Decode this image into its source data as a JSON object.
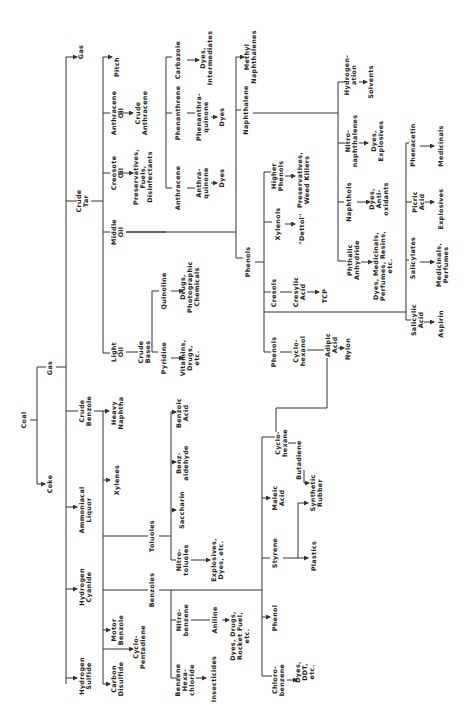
{
  "diagram": {
    "orientation": "rotated 90° counter-clockwise",
    "line_color": "#333333",
    "nodes": [
      {
        "id": "coal",
        "label": "Coal",
        "x": 25,
        "y": 420
      },
      {
        "id": "gas",
        "label": "Gas",
        "x": 51,
        "y": 368
      },
      {
        "id": "coke",
        "label": "Coke",
        "x": 51,
        "y": 484
      },
      {
        "id": "crude_tar",
        "label": "Crude\nTar",
        "x": 83,
        "y": 201
      },
      {
        "id": "gas2",
        "label": "Gas",
        "x": 82,
        "y": 52
      },
      {
        "id": "crude_benzole",
        "label": "Crude\nBenzole",
        "x": 86,
        "y": 411
      },
      {
        "id": "ammoniacal_liquor",
        "label": "Ammoniacal\nLiquor",
        "x": 86,
        "y": 510
      },
      {
        "id": "hydrogen_cyanide",
        "label": "Hydrogen\nCyanide",
        "x": 86,
        "y": 587
      },
      {
        "id": "hydrogen_sulfide",
        "label": "Hydrogen\nSulfide",
        "x": 86,
        "y": 676
      },
      {
        "id": "pitch",
        "label": "Pitch",
        "x": 118,
        "y": 67
      },
      {
        "id": "anthracene_oil",
        "label": "Anthracene\nOil",
        "x": 118,
        "y": 113
      },
      {
        "id": "crude_anthracene",
        "label": "Crude\nAnthracene",
        "x": 142,
        "y": 113
      },
      {
        "id": "creosote_oil",
        "label": "Creosote\nOil",
        "x": 118,
        "y": 173
      },
      {
        "id": "preservatives_fuels",
        "label": "Preservatives,\nFuels,\nDisinfectants",
        "x": 144,
        "y": 177
      },
      {
        "id": "middle_oil",
        "label": "Middle\nOil",
        "x": 118,
        "y": 232
      },
      {
        "id": "light_oil",
        "label": "Light\nOil",
        "x": 118,
        "y": 352
      },
      {
        "id": "crude_bases",
        "label": "Crude\nBases",
        "x": 145,
        "y": 352
      },
      {
        "id": "quinoline",
        "label": "Quinoline",
        "x": 165,
        "y": 291
      },
      {
        "id": "drugs_photo",
        "label": "Drugs,\nPhotographic\nChemicals",
        "x": 191,
        "y": 287
      },
      {
        "id": "pyridine",
        "label": "Pyridine",
        "x": 165,
        "y": 358
      },
      {
        "id": "vitamins",
        "label": "Vitamins,\nDrugs,\netc.",
        "x": 191,
        "y": 358
      },
      {
        "id": "heavy_naphtha",
        "label": "Heavy\nNaphtha",
        "x": 118,
        "y": 413
      },
      {
        "id": "xylenes",
        "label": "Xylenes",
        "x": 118,
        "y": 480
      },
      {
        "id": "toluoles",
        "label": "Toluoles",
        "x": 153,
        "y": 536
      },
      {
        "id": "benzoles",
        "label": "Benzoles",
        "x": 153,
        "y": 590
      },
      {
        "id": "motor_benzole",
        "label": "Motor\nBenzole",
        "x": 118,
        "y": 630
      },
      {
        "id": "cyclopentadiene",
        "label": "Cyclo-\nPentadiene",
        "x": 140,
        "y": 647
      },
      {
        "id": "carbon_disulfide",
        "label": "Carbon\nDisulfide",
        "x": 118,
        "y": 679
      },
      {
        "id": "benzoic_acid",
        "label": "Benzoic\nAcid",
        "x": 183,
        "y": 413
      },
      {
        "id": "benzaldehyde",
        "label": "Benz-\naldehyde",
        "x": 183,
        "y": 463
      },
      {
        "id": "saccharin",
        "label": "Saccharin",
        "x": 183,
        "y": 510
      },
      {
        "id": "nitrotoluoles",
        "label": "Nitro-\ntoluoles",
        "x": 183,
        "y": 560
      },
      {
        "id": "explosives_dyes",
        "label": "Explosives,\nDyes, etc.",
        "x": 218,
        "y": 560
      },
      {
        "id": "nitrobenzene",
        "label": "Nitro-\nbenzene",
        "x": 183,
        "y": 620
      },
      {
        "id": "aniline",
        "label": "Aniline",
        "x": 216,
        "y": 620
      },
      {
        "id": "dyes_drugs_rocket",
        "label": "Dyes, Drugs,\nRocket Fuel,\netc.",
        "x": 241,
        "y": 636
      },
      {
        "id": "benzene_hexachloride",
        "label": "Benzene\nHexa-\nchloride",
        "x": 186,
        "y": 680
      },
      {
        "id": "insecticides",
        "label": "Insecticides",
        "x": 215,
        "y": 679
      },
      {
        "id": "cyclohexane",
        "label": "Cyclo-\nhexane",
        "x": 282,
        "y": 443
      },
      {
        "id": "butadiene",
        "label": "Butadiene",
        "x": 300,
        "y": 460
      },
      {
        "id": "maleic_acid",
        "label": "Maleic\nAcid",
        "x": 279,
        "y": 498
      },
      {
        "id": "synthetic_rubber",
        "label": "Synthetic\nRubber",
        "x": 317,
        "y": 493
      },
      {
        "id": "styrene",
        "label": "Styrene",
        "x": 276,
        "y": 553
      },
      {
        "id": "plastics",
        "label": "Plastics",
        "x": 315,
        "y": 556
      },
      {
        "id": "phenol",
        "label": "Phenol",
        "x": 276,
        "y": 618
      },
      {
        "id": "chlorobenzene",
        "label": "Chloro-\nbenzene",
        "x": 279,
        "y": 680
      },
      {
        "id": "dyes_ddt",
        "label": "Dyes,\nDDT,\netc.",
        "x": 306,
        "y": 672
      },
      {
        "id": "anthracene",
        "label": "Anthracene",
        "x": 179,
        "y": 188
      },
      {
        "id": "anthraquinone",
        "label": "Anthra-\nquinone",
        "x": 203,
        "y": 183
      },
      {
        "id": "dyes_a",
        "label": "Dyes",
        "x": 223,
        "y": 178
      },
      {
        "id": "phenanthrene",
        "label": "Phenanthrene",
        "x": 179,
        "y": 113
      },
      {
        "id": "phenanthraquinone",
        "label": "Phenanthra-\nquinone",
        "x": 203,
        "y": 117
      },
      {
        "id": "dyes_b",
        "label": "Dyes",
        "x": 223,
        "y": 117
      },
      {
        "id": "carbazole",
        "label": "Carbazole",
        "x": 179,
        "y": 60
      },
      {
        "id": "dyes_intermediates",
        "label": "Dyes,\nIntermediates",
        "x": 207,
        "y": 58
      },
      {
        "id": "phenols_top",
        "label": "Phenols",
        "x": 249,
        "y": 262
      },
      {
        "id": "naphthalene",
        "label": "Naphthalene",
        "x": 247,
        "y": 110
      },
      {
        "id": "methyl_naphthalenes",
        "label": "Methyl\nNaphthalenes",
        "x": 251,
        "y": 57
      },
      {
        "id": "higher_phenols",
        "label": "Higher\nPhenols",
        "x": 278,
        "y": 176
      },
      {
        "id": "preservatives_weed",
        "label": "Preservatives,\nWeed Killers",
        "x": 304,
        "y": 180
      },
      {
        "id": "xylenols",
        "label": "Xylenols",
        "x": 279,
        "y": 224
      },
      {
        "id": "dettol",
        "label": "\"Dettol\"",
        "x": 303,
        "y": 229
      },
      {
        "id": "cresols",
        "label": "Cresols",
        "x": 275,
        "y": 293
      },
      {
        "id": "cresylic_acid",
        "label": "Cresylic\nAcid",
        "x": 300,
        "y": 292
      },
      {
        "id": "tcp",
        "label": "TCP",
        "x": 326,
        "y": 296
      },
      {
        "id": "phenols_bottom",
        "label": "Phenols",
        "x": 275,
        "y": 352
      },
      {
        "id": "cyclohexanol",
        "label": "Cyclo-\nhexanol",
        "x": 300,
        "y": 351
      },
      {
        "id": "adipic_acid",
        "label": "Adipic\nAcid",
        "x": 332,
        "y": 345
      },
      {
        "id": "nylon",
        "label": "Nylon",
        "x": 349,
        "y": 349
      },
      {
        "id": "hydrogenation",
        "label": "Hydrogen-\nation",
        "x": 351,
        "y": 75
      },
      {
        "id": "solvents",
        "label": "Solvents",
        "x": 372,
        "y": 82
      },
      {
        "id": "nitronaphthalenes",
        "label": "Nitro-\nnaphthalenes",
        "x": 352,
        "y": 141
      },
      {
        "id": "dyes_explosives",
        "label": "Dyes,\nExplosives",
        "x": 378,
        "y": 141
      },
      {
        "id": "naphthols",
        "label": "Naphthols",
        "x": 350,
        "y": 202
      },
      {
        "id": "dyes_antioxidants",
        "label": "Dyes,\nAnti-\noxidants",
        "x": 380,
        "y": 199
      },
      {
        "id": "phthalic_anhydride",
        "label": "Phthalic\nAnhydride",
        "x": 354,
        "y": 260
      },
      {
        "id": "dyes_medicinals_perfumes",
        "label": "Dyes, Medicinals,\nPerfumes, Resins,\netc.",
        "x": 384,
        "y": 266
      },
      {
        "id": "phenacetin",
        "label": "Phenacetin",
        "x": 414,
        "y": 145
      },
      {
        "id": "medicinals",
        "label": "Medicinals",
        "x": 442,
        "y": 146
      },
      {
        "id": "picric_acid",
        "label": "Picric\nAcid",
        "x": 419,
        "y": 202
      },
      {
        "id": "explosives",
        "label": "Explosives",
        "x": 442,
        "y": 209
      },
      {
        "id": "salicylates",
        "label": "Salicylates",
        "x": 414,
        "y": 258
      },
      {
        "id": "medicinals_perfumes",
        "label": "Medicinals,\nPerfumes",
        "x": 443,
        "y": 265
      },
      {
        "id": "salicylic_acid",
        "label": "Salicylic\nAcid",
        "x": 418,
        "y": 320
      },
      {
        "id": "aspirin",
        "label": "Aspirin",
        "x": 442,
        "y": 324
      }
    ]
  }
}
